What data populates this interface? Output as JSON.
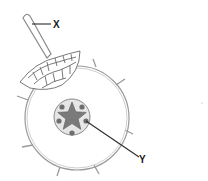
{
  "diagram": {
    "labels": {
      "x": "X",
      "y": "Y"
    },
    "parts": [
      {
        "id": "root-hair",
        "label": "X"
      },
      {
        "id": "xylem-phloem-vascular-bundle",
        "label": "Y"
      },
      {
        "id": "epidermis-cells"
      },
      {
        "id": "cortex"
      },
      {
        "id": "stele"
      }
    ],
    "colors": {
      "outline": "#8a8a8a",
      "dark_line": "#2b2b2b",
      "star_fill": "#7a7a7a",
      "stele_fill": "#e4e4e4",
      "dot_fill": "#6e6e6e",
      "background": "#ffffff"
    }
  }
}
